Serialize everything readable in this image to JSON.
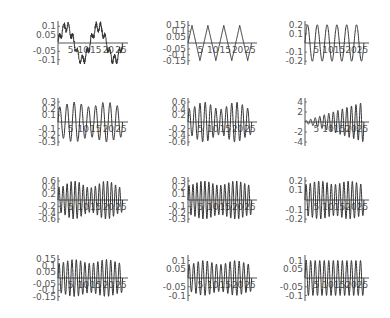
{
  "chart_data": [
    {
      "type": "line",
      "panel": 1,
      "row": 0,
      "col": 0,
      "title": "",
      "xlabel": "",
      "ylabel": "",
      "x_ticks": [
        "5",
        "10",
        "15",
        "20",
        "25"
      ],
      "y_ticks": [
        "0.1",
        "0.05",
        "-0.05",
        "-0.1"
      ],
      "ylim": [
        -0.12,
        0.12
      ],
      "xlim": [
        0,
        27
      ],
      "signal": {
        "kind": "slow",
        "amp": 0.1,
        "periods": 2,
        "noise": 0.025,
        "growth": 0,
        "beat": 0
      }
    },
    {
      "type": "line",
      "panel": 2,
      "row": 0,
      "col": 1,
      "x_ticks": [
        "5",
        "10",
        "15",
        "20",
        "25"
      ],
      "y_ticks": [
        "0.15",
        "0.1",
        "0.05",
        "-0.05",
        "-0.1",
        "-0.15"
      ],
      "ylim": [
        -0.17,
        0.17
      ],
      "xlim": [
        0,
        27
      ],
      "signal": {
        "kind": "tri",
        "amp": 0.15,
        "periods": 4,
        "noise": 0,
        "growth": 0,
        "beat": 0
      }
    },
    {
      "type": "line",
      "panel": 3,
      "row": 0,
      "col": 2,
      "x_ticks": [
        "5",
        "10",
        "15",
        "20",
        "25"
      ],
      "y_ticks": [
        "0.2",
        "0.1",
        "-0.1",
        "-0.2"
      ],
      "ylim": [
        -0.22,
        0.22
      ],
      "xlim": [
        0,
        27
      ],
      "signal": {
        "kind": "sin",
        "amp": 0.2,
        "periods": 6,
        "noise": 0,
        "growth": 0,
        "beat": 0
      }
    },
    {
      "type": "line",
      "panel": 4,
      "row": 1,
      "col": 0,
      "x_ticks": [
        "5",
        "10",
        "15",
        "20",
        "25"
      ],
      "y_ticks": [
        "0.3",
        "0.2",
        "0.1",
        "-0.1",
        "-0.2",
        "-0.3"
      ],
      "ylim": [
        -0.33,
        0.33
      ],
      "xlim": [
        0,
        27
      ],
      "signal": {
        "kind": "sin",
        "amp": 0.3,
        "periods": 9,
        "noise": 0,
        "growth": 0,
        "beat": 0.35
      }
    },
    {
      "type": "line",
      "panel": 5,
      "row": 1,
      "col": 1,
      "x_ticks": [
        "5",
        "10",
        "15",
        "20",
        "25"
      ],
      "y_ticks": [
        "0.6",
        "0.4",
        "0.2",
        "-0.2",
        "-0.4",
        "-0.6"
      ],
      "ylim": [
        -0.66,
        0.66
      ],
      "xlim": [
        0,
        27
      ],
      "signal": {
        "kind": "sin",
        "amp": 0.6,
        "periods": 12,
        "noise": 0,
        "growth": 0,
        "beat": 1.2
      }
    },
    {
      "type": "line",
      "panel": 6,
      "row": 1,
      "col": 2,
      "x_ticks": [
        "5",
        "10",
        "15",
        "20",
        "25"
      ],
      "y_ticks": [
        "4",
        "2",
        "-2",
        "-4"
      ],
      "ylim": [
        -4.4,
        4.4
      ],
      "xlim": [
        0,
        27
      ],
      "signal": {
        "kind": "sin",
        "amp": 4,
        "periods": 13,
        "noise": 0,
        "growth": 1,
        "beat": 0
      }
    },
    {
      "type": "line",
      "panel": 7,
      "row": 2,
      "col": 0,
      "x_ticks": [
        "5",
        "10",
        "15",
        "20",
        "25"
      ],
      "y_ticks": [
        "0.6",
        "0.4",
        "0.2",
        "-0.2",
        "-0.4",
        "-0.6"
      ],
      "ylim": [
        -0.66,
        0.66
      ],
      "xlim": [
        0,
        27
      ],
      "signal": {
        "kind": "sin",
        "amp": 0.6,
        "periods": 16,
        "noise": 0,
        "growth": 0,
        "beat": 1.1
      }
    },
    {
      "type": "line",
      "panel": 8,
      "row": 2,
      "col": 1,
      "x_ticks": [
        "5",
        "10",
        "15",
        "20",
        "25"
      ],
      "y_ticks": [
        "0.3",
        "0.2",
        "0.1",
        "-0.1",
        "-0.2",
        "-0.3"
      ],
      "ylim": [
        -0.33,
        0.33
      ],
      "xlim": [
        0,
        27
      ],
      "signal": {
        "kind": "sin",
        "amp": 0.3,
        "periods": 16,
        "noise": 0,
        "growth": 0,
        "beat": 0.3
      }
    },
    {
      "type": "line",
      "panel": 9,
      "row": 2,
      "col": 2,
      "x_ticks": [
        "5",
        "10",
        "15",
        "20",
        "25"
      ],
      "y_ticks": [
        "0.2",
        "0.1",
        "-0.1",
        "-0.2"
      ],
      "ylim": [
        -0.22,
        0.22
      ],
      "xlim": [
        0,
        27
      ],
      "signal": {
        "kind": "sin",
        "amp": 0.2,
        "periods": 14,
        "noise": 0,
        "growth": 0,
        "beat": 0.2
      }
    },
    {
      "type": "line",
      "panel": 10,
      "row": 3,
      "col": 0,
      "x_ticks": [
        "5",
        "10",
        "15",
        "20",
        "25"
      ],
      "y_ticks": [
        "0.15",
        "0.1",
        "0.05",
        "-0.05",
        "-0.1",
        "-0.15"
      ],
      "ylim": [
        -0.17,
        0.17
      ],
      "xlim": [
        0,
        27
      ],
      "signal": {
        "kind": "sin",
        "amp": 0.15,
        "periods": 15,
        "noise": 0,
        "growth": 0,
        "beat": 0.25
      }
    },
    {
      "type": "line",
      "panel": 11,
      "row": 3,
      "col": 1,
      "x_ticks": [
        "5",
        "10",
        "15",
        "20",
        "25"
      ],
      "y_ticks": [
        "0.1",
        "0.05",
        "-0.05",
        "-0.1"
      ],
      "ylim": [
        -0.12,
        0.12
      ],
      "xlim": [
        0,
        27
      ],
      "signal": {
        "kind": "sin",
        "amp": 0.1,
        "periods": 14,
        "noise": 0,
        "growth": 0,
        "beat": 0.3
      }
    },
    {
      "type": "line",
      "panel": 12,
      "row": 3,
      "col": 2,
      "x_ticks": [
        "5",
        "10",
        "15",
        "20",
        "25"
      ],
      "y_ticks": [
        "0.1",
        "0.05",
        "-0.05",
        "-0.1"
      ],
      "ylim": [
        -0.12,
        0.12
      ],
      "xlim": [
        0,
        27
      ],
      "signal": {
        "kind": "sin",
        "amp": 0.1,
        "periods": 13,
        "noise": 0,
        "growth": 0,
        "beat": 0
      }
    }
  ],
  "layout": {
    "col_axis_x": [
      58,
      188,
      305
    ],
    "row_zero_y": [
      43,
      122,
      200,
      278
    ],
    "plot_width": [
      68,
      67,
      62
    ],
    "half_height": [
      20,
      22,
      21,
      21
    ],
    "line_color": "#333333",
    "axis_color": "#555555",
    "label_color": "#555555"
  }
}
